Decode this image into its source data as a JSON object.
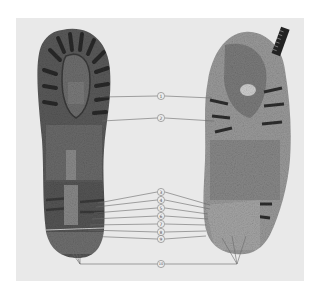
{
  "figure": {
    "background_color": "#e9e9e9",
    "left_item": "boot-sole",
    "right_item": "sole-impression",
    "callouts": [
      {
        "label": "1",
        "y": 96
      },
      {
        "label": "2",
        "y": 118
      },
      {
        "label": "3",
        "y": 192
      },
      {
        "label": "4",
        "y": 200
      },
      {
        "label": "5",
        "y": 208
      },
      {
        "label": "6",
        "y": 216
      },
      {
        "label": "7",
        "y": 224
      },
      {
        "label": "8",
        "y": 232
      },
      {
        "label": "9",
        "y": 239
      },
      {
        "label": "10",
        "y": 264
      }
    ]
  }
}
